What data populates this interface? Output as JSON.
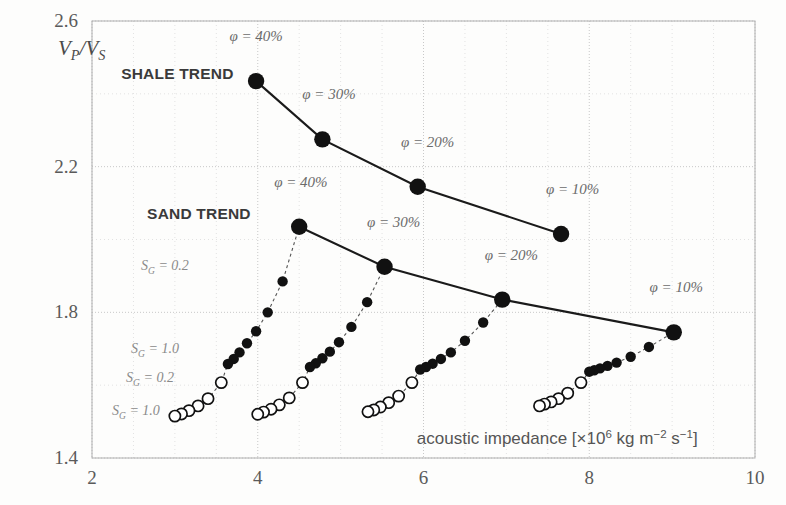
{
  "chart_data": {
    "type": "scatter",
    "title": "",
    "xlabel": "acoustic impedance",
    "xunit_prefix": "[×10",
    "xunit_exp": "6",
    "xunit_rest": " kg m",
    "xunit_exp2": "−2",
    "xunit_rest2": " s",
    "xunit_exp3": "−1",
    "xunit_close": "]",
    "ylabel": "V_P/V_S",
    "ylabel_main": "V",
    "ylabel_sub1": "P",
    "ylabel_mid": "/V",
    "ylabel_sub2": "S",
    "xlim": [
      2,
      10
    ],
    "ylim": [
      1.4,
      2.6
    ],
    "xticks": [
      2,
      4,
      6,
      8,
      10
    ],
    "xticklabels": [
      "2",
      "4",
      "6",
      "8",
      "10"
    ],
    "yticks": [
      1.4,
      1.8,
      2.2,
      2.6
    ],
    "yticklabels": [
      "1.4",
      "1.8",
      "2.2",
      "2.6"
    ],
    "x_gridlines": [
      2,
      2.5,
      3,
      3.5,
      4,
      4.5,
      5,
      5.5,
      6,
      6.5,
      7,
      7.5,
      8,
      8.5,
      9,
      9.5,
      10
    ],
    "y_gridlines": [
      1.4,
      1.6,
      1.8,
      2.0,
      2.2,
      2.4,
      2.6
    ],
    "grid": true,
    "legend_position": "none",
    "series": [
      {
        "name": "SHALE TREND",
        "style": "solid-line-filled-markers",
        "label_x": 3.03,
        "label_y": 2.44,
        "points": [
          {
            "x": 3.98,
            "y": 2.435,
            "label": "φ = 40%",
            "lx": 3.98,
            "ly": 2.545
          },
          {
            "x": 4.78,
            "y": 2.275,
            "label": "φ = 30%",
            "lx": 4.86,
            "ly": 2.385
          },
          {
            "x": 5.93,
            "y": 2.145,
            "label": "φ = 20%",
            "lx": 6.05,
            "ly": 2.255
          },
          {
            "x": 7.66,
            "y": 2.015,
            "label": "φ = 10%",
            "lx": 7.8,
            "ly": 2.125
          }
        ]
      },
      {
        "name": "SAND TREND",
        "style": "solid-line-filled-markers",
        "label_x": 3.29,
        "label_y": 2.055,
        "points": [
          {
            "x": 4.5,
            "y": 2.035,
            "label": "φ = 40%",
            "lx": 4.52,
            "ly": 2.145
          },
          {
            "x": 5.53,
            "y": 1.925,
            "label": "φ = 30%",
            "lx": 5.64,
            "ly": 2.035
          },
          {
            "x": 6.95,
            "y": 1.835,
            "label": "φ = 20%",
            "lx": 7.06,
            "ly": 1.945
          },
          {
            "x": 9.02,
            "y": 1.745,
            "label": "φ = 10%",
            "lx": 9.05,
            "ly": 1.855
          }
        ]
      }
    ],
    "saturation_labels": [
      {
        "text": "S_G = 0.2",
        "main": "S",
        "sub": "G",
        "rest": " = 0.2",
        "x": 2.88,
        "y": 1.915
      },
      {
        "text": "S_G = 1.0",
        "main": "S",
        "sub": "G",
        "rest": " = 1.0",
        "x": 2.76,
        "y": 1.688
      },
      {
        "text": "S_G = 0.2",
        "main": "S",
        "sub": "G",
        "rest": " = 0.2",
        "x": 2.7,
        "y": 1.608
      },
      {
        "text": "S_G = 1.0",
        "main": "S",
        "sub": "G",
        "rest": " = 1.0",
        "x": 2.53,
        "y": 1.517
      }
    ],
    "clusters": [
      {
        "name": "cluster-phi-40",
        "connects_to_phi": "40%",
        "filled": [
          {
            "x": 4.3,
            "y": 1.885
          },
          {
            "x": 4.12,
            "y": 1.8
          },
          {
            "x": 3.98,
            "y": 1.748
          },
          {
            "x": 3.87,
            "y": 1.715
          },
          {
            "x": 3.78,
            "y": 1.69
          },
          {
            "x": 3.71,
            "y": 1.672
          },
          {
            "x": 3.64,
            "y": 1.658
          }
        ],
        "open": [
          {
            "x": 3.56,
            "y": 1.607
          },
          {
            "x": 3.4,
            "y": 1.563
          },
          {
            "x": 3.28,
            "y": 1.543
          },
          {
            "x": 3.17,
            "y": 1.53
          },
          {
            "x": 3.08,
            "y": 1.521
          },
          {
            "x": 3.0,
            "y": 1.515
          }
        ]
      },
      {
        "name": "cluster-phi-30",
        "connects_to_phi": "30%",
        "filled": [
          {
            "x": 5.32,
            "y": 1.828
          },
          {
            "x": 5.13,
            "y": 1.76
          },
          {
            "x": 4.98,
            "y": 1.718
          },
          {
            "x": 4.87,
            "y": 1.692
          },
          {
            "x": 4.78,
            "y": 1.674
          },
          {
            "x": 4.7,
            "y": 1.66
          },
          {
            "x": 4.63,
            "y": 1.65
          }
        ],
        "open": [
          {
            "x": 4.54,
            "y": 1.607
          },
          {
            "x": 4.38,
            "y": 1.565
          },
          {
            "x": 4.26,
            "y": 1.546
          },
          {
            "x": 4.16,
            "y": 1.534
          },
          {
            "x": 4.07,
            "y": 1.526
          },
          {
            "x": 4.0,
            "y": 1.52
          }
        ]
      },
      {
        "name": "cluster-phi-20",
        "connects_to_phi": "20%",
        "filled": [
          {
            "x": 6.72,
            "y": 1.772
          },
          {
            "x": 6.5,
            "y": 1.722
          },
          {
            "x": 6.33,
            "y": 1.69
          },
          {
            "x": 6.21,
            "y": 1.672
          },
          {
            "x": 6.11,
            "y": 1.659
          },
          {
            "x": 6.03,
            "y": 1.65
          },
          {
            "x": 5.96,
            "y": 1.643
          }
        ],
        "open": [
          {
            "x": 5.86,
            "y": 1.607
          },
          {
            "x": 5.7,
            "y": 1.57
          },
          {
            "x": 5.58,
            "y": 1.552
          },
          {
            "x": 5.48,
            "y": 1.54
          },
          {
            "x": 5.4,
            "y": 1.532
          },
          {
            "x": 5.33,
            "y": 1.527
          }
        ]
      },
      {
        "name": "cluster-phi-10",
        "connects_to_phi": "10%",
        "filled": [
          {
            "x": 8.72,
            "y": 1.705
          },
          {
            "x": 8.5,
            "y": 1.678
          },
          {
            "x": 8.33,
            "y": 1.662
          },
          {
            "x": 8.22,
            "y": 1.653
          },
          {
            "x": 8.13,
            "y": 1.646
          },
          {
            "x": 8.06,
            "y": 1.641
          },
          {
            "x": 8.0,
            "y": 1.637
          }
        ],
        "open": [
          {
            "x": 7.9,
            "y": 1.607
          },
          {
            "x": 7.74,
            "y": 1.578
          },
          {
            "x": 7.63,
            "y": 1.563
          },
          {
            "x": 7.54,
            "y": 1.554
          },
          {
            "x": 7.46,
            "y": 1.548
          },
          {
            "x": 7.4,
            "y": 1.543
          }
        ]
      }
    ],
    "colors": {
      "marker_filled": "#111111",
      "marker_open_stroke": "#111111",
      "marker_open_fill": "#ffffff",
      "trend_line": "#1a1a1a",
      "cluster_line": "#555555",
      "grid_major": "#c8c8c8",
      "grid_minor": "#e2e2e2",
      "frame": "#b0b0b0",
      "background": "#fdfdfc",
      "text": "#4a4a4a"
    }
  }
}
